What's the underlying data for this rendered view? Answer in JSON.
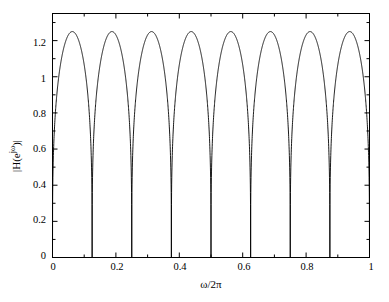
{
  "figure": {
    "background_color": "#ffffff",
    "axis_color": "#000000",
    "line_color": "#000000"
  },
  "axes": {
    "xlabel": "ω/2π",
    "ylabel_prefix": "|H(e",
    "ylabel_sup": "jω",
    "ylabel_suffix": ")|",
    "ylabel_full": "|H(e^{jω})|",
    "xticks": [
      "0",
      "0.2",
      "0.4",
      "0.6",
      "0.8",
      "1"
    ],
    "xtick_values": [
      0,
      0.2,
      0.4,
      0.6,
      0.8,
      1
    ],
    "yticks": [
      "0",
      "0.2",
      "0.4",
      "0.6",
      "0.8",
      "1",
      "1.2"
    ],
    "ytick_values": [
      0,
      0.2,
      0.4,
      0.6,
      0.8,
      1,
      1.2
    ],
    "xminor_values": [
      0.1,
      0.3,
      0.5,
      0.7,
      0.9
    ],
    "yminor_values": [
      0.1,
      0.3,
      0.5,
      0.7,
      0.9,
      1.1,
      1.3
    ]
  },
  "chart_data": {
    "type": "line",
    "title": "",
    "xlabel": "ω/2π",
    "ylabel": "|H(e^{jω})|",
    "xlim": [
      0,
      1
    ],
    "ylim": [
      0,
      1.35
    ],
    "grid": false,
    "legend": null,
    "num_lobes": 8,
    "peak_value": 1.25,
    "null_positions": [
      0,
      0.125,
      0.25,
      0.375,
      0.5,
      0.625,
      0.75,
      0.875,
      1
    ],
    "peak_positions": [
      0.0625,
      0.1875,
      0.3125,
      0.4375,
      0.5625,
      0.6875,
      0.8125,
      0.9375
    ],
    "series": [
      {
        "name": "|H(e^{jω})|",
        "x": [
          0,
          0.005,
          0.01,
          0.015,
          0.02,
          0.025,
          0.03,
          0.035,
          0.04,
          0.045,
          0.05,
          0.055,
          0.0625,
          0.07,
          0.075,
          0.08,
          0.085,
          0.09,
          0.095,
          0.1,
          0.105,
          0.11,
          0.115,
          0.12,
          0.125,
          0.13,
          0.135,
          0.14,
          0.145,
          0.15,
          0.16,
          0.17,
          0.18,
          0.1875,
          0.195,
          0.205,
          0.215,
          0.225,
          0.235,
          0.245,
          0.25,
          0.255,
          0.265,
          0.275,
          0.285,
          0.295,
          0.3,
          0.3125,
          0.32,
          0.33,
          0.34,
          0.35,
          0.36,
          0.37,
          0.375,
          0.38,
          0.39,
          0.4,
          0.41,
          0.42,
          0.43,
          0.4375,
          0.445,
          0.455,
          0.465,
          0.475,
          0.485,
          0.495,
          0.5,
          0.505,
          0.515,
          0.525,
          0.535,
          0.545,
          0.555,
          0.5625,
          0.57,
          0.58,
          0.59,
          0.6,
          0.61,
          0.62,
          0.625,
          0.63,
          0.64,
          0.65,
          0.66,
          0.67,
          0.68,
          0.6875,
          0.695,
          0.705,
          0.715,
          0.725,
          0.735,
          0.745,
          0.75,
          0.755,
          0.765,
          0.775,
          0.785,
          0.795,
          0.805,
          0.8125,
          0.82,
          0.83,
          0.84,
          0.85,
          0.86,
          0.87,
          0.875,
          0.88,
          0.89,
          0.9,
          0.91,
          0.92,
          0.93,
          0.9375,
          0.945,
          0.955,
          0.965,
          0.975,
          0.985,
          0.995,
          1
        ],
        "y": [
          0,
          0.155,
          0.31,
          0.46,
          0.6,
          0.74,
          0.86,
          0.97,
          1.06,
          1.14,
          1.19,
          1.23,
          1.25,
          1.24,
          1.23,
          1.2,
          1.15,
          1.09,
          1.01,
          0.92,
          0.8,
          0.66,
          0.5,
          0.28,
          0,
          0.28,
          0.5,
          0.66,
          0.8,
          0.92,
          1.09,
          1.2,
          1.24,
          1.25,
          1.24,
          1.2,
          1.12,
          1.0,
          0.83,
          0.55,
          0,
          0.55,
          0.83,
          1.0,
          1.12,
          1.2,
          1.22,
          1.25,
          1.24,
          1.22,
          1.18,
          1.1,
          0.97,
          0.7,
          0,
          0.7,
          0.97,
          1.1,
          1.18,
          1.22,
          1.24,
          1.25,
          1.24,
          1.22,
          1.17,
          1.09,
          0.95,
          0.62,
          0,
          0.62,
          0.95,
          1.09,
          1.17,
          1.22,
          1.24,
          1.25,
          1.24,
          1.22,
          1.18,
          1.1,
          0.97,
          0.7,
          0,
          0.7,
          0.97,
          1.1,
          1.18,
          1.22,
          1.24,
          1.25,
          1.24,
          1.22,
          1.17,
          1.09,
          0.95,
          0.62,
          0,
          0.62,
          0.95,
          1.09,
          1.17,
          1.22,
          1.24,
          1.25,
          1.24,
          1.22,
          1.18,
          1.1,
          0.97,
          0.7,
          0,
          0.7,
          0.97,
          1.1,
          1.18,
          1.22,
          1.24,
          1.25,
          1.24,
          1.22,
          1.17,
          1.09,
          0.93,
          0.45,
          0
        ]
      }
    ]
  }
}
